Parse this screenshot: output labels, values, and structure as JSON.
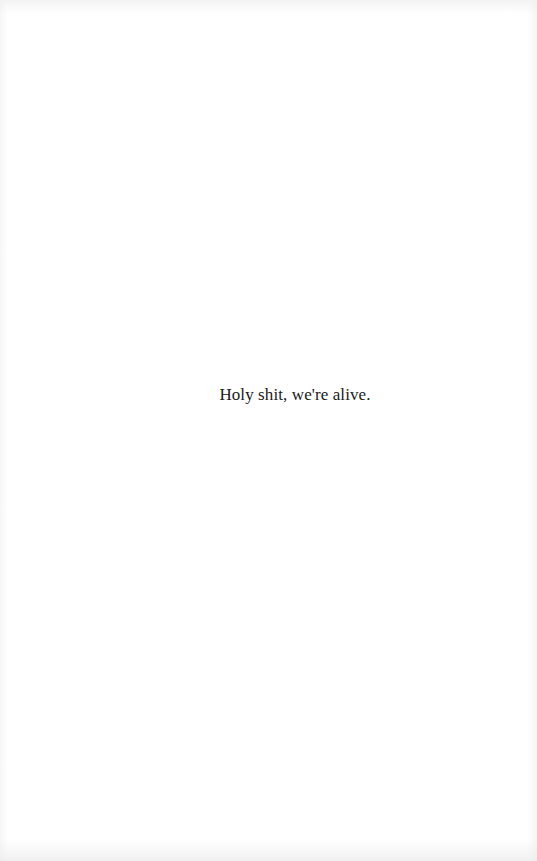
{
  "page": {
    "background": "#ffffff",
    "text_color": "#1a1a1a",
    "lines": [
      "Holy shit, we're alive."
    ]
  }
}
